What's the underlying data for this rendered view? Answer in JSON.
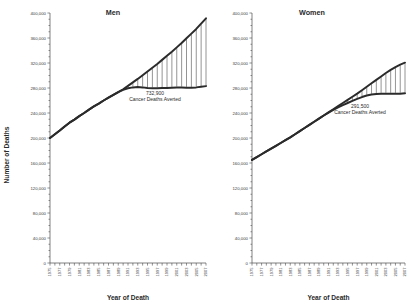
{
  "figure": {
    "xlabel": "Year of Death",
    "ylabel": "Number of Deaths"
  },
  "chart_data": [
    {
      "type": "area",
      "title": "Men",
      "xlabel": "Year of Death",
      "ylabel": "Number of Deaths",
      "ylim": [
        0,
        400000
      ],
      "yticks": [
        0,
        40000,
        80000,
        120000,
        160000,
        200000,
        240000,
        280000,
        320000,
        360000,
        400000
      ],
      "ytick_labels": [
        "0",
        "40,000",
        "80,000",
        "120,000",
        "160,000",
        "200,000",
        "240,000",
        "280,000",
        "320,000",
        "360,000",
        "400,000"
      ],
      "xlim": [
        1975,
        2007
      ],
      "x": [
        1975,
        1976,
        1977,
        1978,
        1979,
        1980,
        1981,
        1982,
        1983,
        1984,
        1985,
        1986,
        1987,
        1988,
        1989,
        1990,
        1991,
        1992,
        1993,
        1994,
        1995,
        1996,
        1997,
        1998,
        1999,
        2000,
        2001,
        2002,
        2003,
        2004,
        2005,
        2006,
        2007
      ],
      "xtick_labels": [
        "1975",
        "1977",
        "1979",
        "1981",
        "1983",
        "1985",
        "1987",
        "1989",
        "1991",
        "1993",
        "1995",
        "1997",
        "1999",
        "2001",
        "2003",
        "2005",
        "2007"
      ],
      "grid": false,
      "legend": "none",
      "annotation_value": "732,900",
      "annotation_label": "Cancer Deaths Averted",
      "series": [
        {
          "name": "expected-deaths-1975-rates",
          "values": [
            200000,
            206000,
            212000,
            218500,
            224500,
            229500,
            235000,
            240000,
            245500,
            250500,
            255000,
            260000,
            264500,
            269000,
            273500,
            278000,
            283500,
            289000,
            294500,
            300500,
            306500,
            312500,
            318500,
            325000,
            331500,
            338000,
            345000,
            352000,
            359500,
            367000,
            374500,
            383000,
            391500
          ]
        },
        {
          "name": "actual-deaths-observed",
          "values": [
            200000,
            206000,
            212000,
            218500,
            224500,
            229500,
            235000,
            240000,
            245500,
            250500,
            255000,
            260000,
            264500,
            269000,
            273500,
            277000,
            279500,
            281000,
            281500,
            281000,
            280000,
            279500,
            279500,
            280000,
            280000,
            280500,
            281000,
            281000,
            280500,
            280500,
            281000,
            282000,
            283000
          ]
        }
      ]
    },
    {
      "type": "area",
      "title": "Women",
      "xlabel": "Year of Death",
      "ylabel": "Number of Deaths",
      "ylim": [
        0,
        400000
      ],
      "yticks": [
        0,
        40000,
        80000,
        120000,
        160000,
        200000,
        240000,
        280000,
        320000,
        360000,
        400000
      ],
      "ytick_labels": [
        "0",
        "40,000",
        "80,000",
        "120,000",
        "160,000",
        "200,000",
        "240,000",
        "280,000",
        "320,000",
        "360,000",
        "400,000"
      ],
      "xlim": [
        1975,
        2007
      ],
      "x": [
        1975,
        1976,
        1977,
        1978,
        1979,
        1980,
        1981,
        1982,
        1983,
        1984,
        1985,
        1986,
        1987,
        1988,
        1989,
        1990,
        1991,
        1992,
        1993,
        1994,
        1995,
        1996,
        1997,
        1998,
        1999,
        2000,
        2001,
        2002,
        2003,
        2004,
        2005,
        2006,
        2007
      ],
      "xtick_labels": [
        "1975",
        "1977",
        "1979",
        "1981",
        "1983",
        "1985",
        "1987",
        "1989",
        "1991",
        "1993",
        "1995",
        "1997",
        "1999",
        "2001",
        "2003",
        "2005",
        "2007"
      ],
      "grid": false,
      "legend": "none",
      "annotation_value": "291,500",
      "annotation_label": "Cancer Deaths Averted",
      "series": [
        {
          "name": "expected-deaths-1975-rates",
          "values": [
            165000,
            169500,
            174000,
            178500,
            183000,
            187500,
            192000,
            196500,
            201000,
            206000,
            211000,
            216000,
            221000,
            226000,
            231000,
            236000,
            241000,
            246000,
            251000,
            256000,
            261000,
            266000,
            271000,
            276500,
            282000,
            287500,
            293000,
            298500,
            304000,
            309000,
            313500,
            317500,
            320500
          ]
        },
        {
          "name": "actual-deaths-observed",
          "values": [
            165000,
            169500,
            174000,
            178500,
            183000,
            187500,
            192000,
            196500,
            201000,
            206000,
            211000,
            216000,
            221000,
            226000,
            231000,
            236000,
            240500,
            245000,
            249000,
            252500,
            256000,
            259500,
            262500,
            265500,
            268000,
            269500,
            270500,
            271000,
            271000,
            271000,
            271000,
            271000,
            271500
          ]
        }
      ]
    }
  ]
}
